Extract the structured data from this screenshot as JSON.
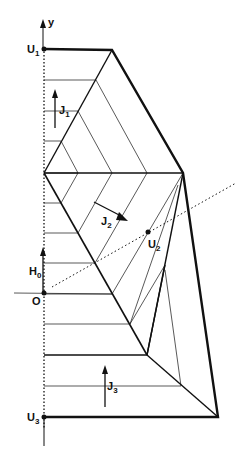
{
  "diagram": {
    "type": "geometric-construction",
    "labels": {
      "y_axis": "y",
      "U1": {
        "main": "U",
        "sub": "1"
      },
      "J1": {
        "main": "J",
        "sub": "1"
      },
      "J2": {
        "main": "J",
        "sub": "2"
      },
      "U2": {
        "main": "U",
        "sub": "2"
      },
      "H0": {
        "main": "H",
        "sub": "0"
      },
      "O": "O",
      "J3": {
        "main": "J",
        "sub": "3"
      },
      "U3": {
        "main": "U",
        "sub": "3"
      }
    },
    "colors": {
      "line": "#111111",
      "background": "#ffffff"
    }
  }
}
